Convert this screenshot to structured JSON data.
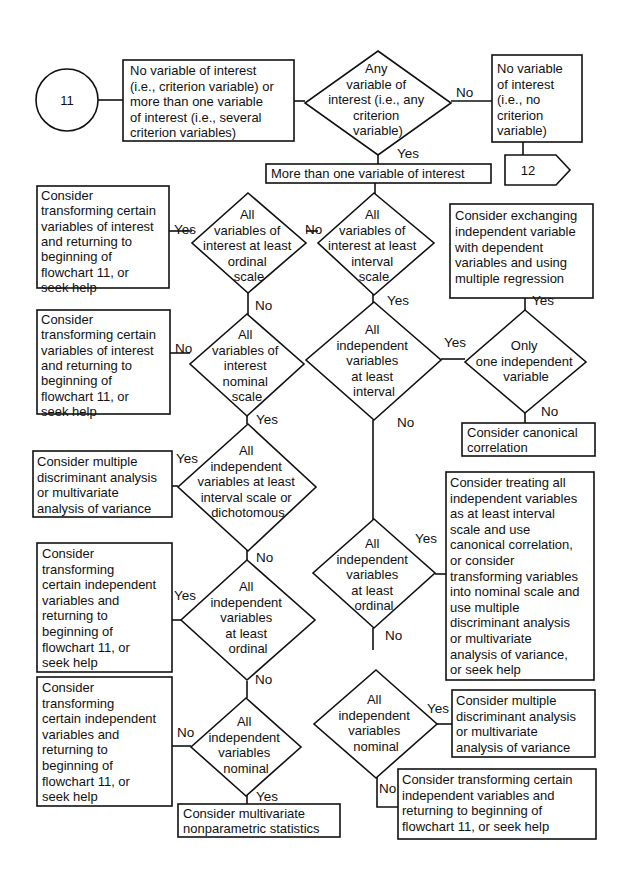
{
  "connectors": {
    "start": "11",
    "end": "12"
  },
  "nodes": {
    "box_no_or_many": [
      "No variable of interest",
      "(i.e., criterion variable) or",
      "more than one variable",
      "of interest (i.e., several",
      "criterion variables)"
    ],
    "dia_any": [
      "Any",
      "variable of",
      "interest (i.e., any",
      "criterion",
      "variable)"
    ],
    "box_no_var": [
      "No variable",
      "of interest",
      "(i.e., no",
      "criterion",
      "variable)"
    ],
    "box_more_than_one": [
      "More than one variable of interest"
    ],
    "dia_ordinal": [
      "All",
      "variables of",
      "interest at least",
      "ordinal",
      "scale"
    ],
    "dia_interval": [
      "All",
      "variables of",
      "interest at least",
      "interval",
      "scale"
    ],
    "box_transform_1": [
      "Consider",
      "transforming certain",
      "variables of interest",
      "and returning to",
      "beginning of",
      "flowchart 11, or",
      "seek help"
    ],
    "box_exchange": [
      "Consider exchanging",
      "independent variable",
      "with dependent",
      "variables and using",
      "multiple regression"
    ],
    "box_transform_2": [
      "Consider",
      "transforming certain",
      "variables of interest",
      "and returning to",
      "beginning of",
      "flowchart 11, or",
      "seek help"
    ],
    "dia_nominal": [
      "All",
      "variables of",
      "interest",
      "nominal",
      "scale"
    ],
    "dia_indep_interval": [
      "All",
      "independent",
      "variables",
      "at least",
      "interval"
    ],
    "dia_one_indep": [
      "Only",
      "one independent",
      "variable"
    ],
    "box_canonical": [
      "Consider canonical",
      "correlation"
    ],
    "box_mda_1": [
      "Consider multiple",
      "discriminant analysis",
      "or multivariate",
      "analysis of variance"
    ],
    "dia_indep_interval_dich": [
      "All",
      "independent",
      "variables at least",
      "interval scale or",
      "dichotomous"
    ],
    "box_treat": [
      "Consider treating all",
      "independent variables",
      "as at least interval",
      "scale and use",
      "canonical correlation,",
      "or consider",
      "transforming variables",
      "into nominal scale and",
      "use multiple",
      "discriminant analysis",
      "or multivariate",
      "analysis of variance,",
      "or seek help"
    ],
    "box_transform_3": [
      "Consider",
      "transforming",
      "certain independent",
      "variables and",
      "returning to",
      "beginning of",
      "flowchart 11, or",
      "seek help"
    ],
    "dia_indep_ordinal_L": [
      "All",
      "independent",
      "variables",
      "at least",
      "ordinal"
    ],
    "dia_indep_ordinal_R": [
      "All",
      "independent",
      "variables",
      "at least",
      "ordinal"
    ],
    "box_transform_4": [
      "Consider",
      "transforming",
      "certain independent",
      "variables and",
      "returning to",
      "beginning of",
      "flowchart 11, or",
      "seek help"
    ],
    "dia_indep_nominal_L": [
      "All",
      "independent",
      "variables",
      "nominal"
    ],
    "dia_indep_nominal_R": [
      "All",
      "independent",
      "variables",
      "nominal"
    ],
    "box_mda_2": [
      "Consider multiple",
      "discriminant analysis",
      "or multivariate",
      "analysis of variance"
    ],
    "box_nonparam": [
      "Consider multivariate",
      "nonparametric statistics"
    ],
    "box_transform_5": [
      "Consider transforming certain",
      "independent variables and",
      "returning to beginning of",
      "flowchart 11, or seek help"
    ]
  },
  "labels": {
    "yes": "Yes",
    "no": "No"
  }
}
